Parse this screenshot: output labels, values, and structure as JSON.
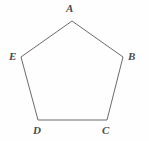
{
  "figure": {
    "name": "pentagon-abcde",
    "kind": "geometry-diagram",
    "shape": "pentagon",
    "background_color": "#fefefe",
    "stroke_color": "#6b6b6b",
    "stroke_width": 1,
    "fill": "none",
    "label_color": "#4a4a4a",
    "canvas": {
      "width": 149,
      "height": 141
    },
    "vertices": [
      {
        "id": "A",
        "label": "A",
        "x": 72,
        "y": 21,
        "label_x": 70,
        "label_y": 9,
        "label_position": "above"
      },
      {
        "id": "B",
        "label": "B",
        "x": 123,
        "y": 57,
        "label_x": 132,
        "label_y": 57,
        "label_position": "right"
      },
      {
        "id": "C",
        "label": "C",
        "x": 107,
        "y": 120,
        "label_x": 106,
        "label_y": 131,
        "label_position": "below"
      },
      {
        "id": "D",
        "label": "D",
        "x": 38,
        "y": 120,
        "label_x": 37,
        "label_y": 131,
        "label_position": "below"
      },
      {
        "id": "E",
        "label": "E",
        "x": 21,
        "y": 57,
        "label_x": 13,
        "label_y": 57,
        "label_position": "left"
      }
    ],
    "edges": [
      {
        "id": "AB",
        "from": "A",
        "to": "B"
      },
      {
        "id": "BC",
        "from": "B",
        "to": "C"
      },
      {
        "id": "CD",
        "from": "C",
        "to": "D"
      },
      {
        "id": "DE",
        "from": "D",
        "to": "E"
      },
      {
        "id": "EA",
        "from": "E",
        "to": "A"
      }
    ],
    "polygon_points": "72,21 123,57 107,120 38,120 21,57"
  }
}
